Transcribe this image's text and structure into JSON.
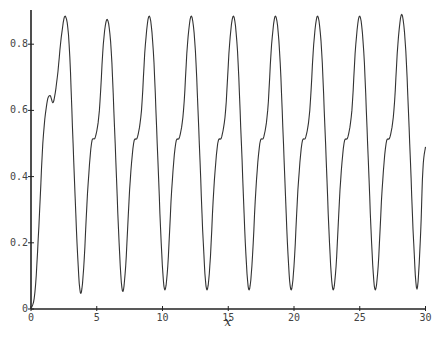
{
  "chart_data": {
    "type": "line",
    "title": "",
    "xlabel": "x",
    "ylabel": "",
    "xlim": [
      0,
      30
    ],
    "ylim": [
      0,
      0.9
    ],
    "grid": false,
    "legend": null,
    "x_ticks": [
      0,
      5,
      10,
      15,
      20,
      25,
      30
    ],
    "y_ticks": [
      0,
      0.2,
      0.4,
      0.6,
      0.8
    ],
    "x_tick_labels": [
      "0",
      "5",
      "10",
      "15",
      "20",
      "25",
      "30"
    ],
    "y_tick_labels": [
      "0",
      "0.2",
      "0.4",
      "0.6",
      "0.8"
    ],
    "series": [
      {
        "name": "y(x)",
        "color": "#333333",
        "points": [
          [
            0,
            0
          ],
          [
            0.3,
            0.05
          ],
          [
            0.6,
            0.25
          ],
          [
            0.9,
            0.5
          ],
          [
            1.2,
            0.62
          ],
          [
            1.45,
            0.645
          ],
          [
            1.7,
            0.625
          ],
          [
            2.0,
            0.7
          ],
          [
            2.3,
            0.82
          ],
          [
            2.6,
            0.885
          ],
          [
            2.9,
            0.8
          ],
          [
            3.2,
            0.5
          ],
          [
            3.5,
            0.2
          ],
          [
            3.75,
            0.05
          ],
          [
            4.0,
            0.12
          ],
          [
            4.3,
            0.35
          ],
          [
            4.6,
            0.5
          ],
          [
            4.9,
            0.52
          ],
          [
            5.2,
            0.6
          ],
          [
            5.5,
            0.8
          ],
          [
            5.8,
            0.875
          ],
          [
            6.1,
            0.78
          ],
          [
            6.4,
            0.5
          ],
          [
            6.7,
            0.2
          ],
          [
            6.95,
            0.055
          ],
          [
            7.2,
            0.13
          ],
          [
            7.5,
            0.36
          ],
          [
            7.8,
            0.5
          ],
          [
            8.1,
            0.52
          ],
          [
            8.4,
            0.6
          ],
          [
            8.7,
            0.8
          ],
          [
            9.0,
            0.885
          ],
          [
            9.3,
            0.78
          ],
          [
            9.6,
            0.5
          ],
          [
            9.9,
            0.2
          ],
          [
            10.15,
            0.06
          ],
          [
            10.4,
            0.13
          ],
          [
            10.7,
            0.36
          ],
          [
            11.0,
            0.5
          ],
          [
            11.3,
            0.52
          ],
          [
            11.6,
            0.6
          ],
          [
            11.9,
            0.8
          ],
          [
            12.2,
            0.885
          ],
          [
            12.5,
            0.78
          ],
          [
            12.8,
            0.5
          ],
          [
            13.1,
            0.2
          ],
          [
            13.35,
            0.06
          ],
          [
            13.6,
            0.13
          ],
          [
            13.9,
            0.36
          ],
          [
            14.2,
            0.5
          ],
          [
            14.5,
            0.52
          ],
          [
            14.8,
            0.6
          ],
          [
            15.1,
            0.8
          ],
          [
            15.4,
            0.885
          ],
          [
            15.7,
            0.78
          ],
          [
            16.0,
            0.5
          ],
          [
            16.3,
            0.2
          ],
          [
            16.55,
            0.06
          ],
          [
            16.8,
            0.13
          ],
          [
            17.1,
            0.36
          ],
          [
            17.4,
            0.5
          ],
          [
            17.7,
            0.52
          ],
          [
            18.0,
            0.6
          ],
          [
            18.3,
            0.8
          ],
          [
            18.6,
            0.885
          ],
          [
            18.9,
            0.78
          ],
          [
            19.2,
            0.5
          ],
          [
            19.5,
            0.2
          ],
          [
            19.75,
            0.06
          ],
          [
            20.0,
            0.13
          ],
          [
            20.3,
            0.36
          ],
          [
            20.6,
            0.5
          ],
          [
            20.9,
            0.52
          ],
          [
            21.2,
            0.6
          ],
          [
            21.5,
            0.8
          ],
          [
            21.8,
            0.885
          ],
          [
            22.1,
            0.78
          ],
          [
            22.4,
            0.5
          ],
          [
            22.7,
            0.2
          ],
          [
            22.95,
            0.06
          ],
          [
            23.2,
            0.13
          ],
          [
            23.5,
            0.36
          ],
          [
            23.8,
            0.5
          ],
          [
            24.1,
            0.52
          ],
          [
            24.4,
            0.6
          ],
          [
            24.7,
            0.8
          ],
          [
            25.0,
            0.885
          ],
          [
            25.3,
            0.78
          ],
          [
            25.6,
            0.5
          ],
          [
            25.9,
            0.2
          ],
          [
            26.15,
            0.06
          ],
          [
            26.4,
            0.13
          ],
          [
            26.7,
            0.36
          ],
          [
            27.0,
            0.5
          ],
          [
            27.3,
            0.52
          ],
          [
            27.6,
            0.6
          ],
          [
            27.9,
            0.8
          ],
          [
            28.2,
            0.89
          ],
          [
            28.5,
            0.78
          ],
          [
            28.8,
            0.5
          ],
          [
            29.1,
            0.2
          ],
          [
            29.35,
            0.06
          ],
          [
            29.6,
            0.2
          ],
          [
            29.8,
            0.42
          ],
          [
            30.0,
            0.49
          ]
        ]
      }
    ]
  }
}
